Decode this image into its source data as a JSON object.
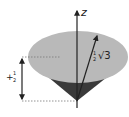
{
  "diagram": {
    "axis_label": "z",
    "vector_label": {
      "fraction_num": "1",
      "fraction_den": "2",
      "root": "√3"
    },
    "projection_label": {
      "sign": "+",
      "fraction_num": "1",
      "fraction_den": "2"
    },
    "colors": {
      "cone_top": "#b9b9b9",
      "cone_side": "#3a3a3a",
      "axis": "#222222",
      "dotted": "#777777"
    }
  }
}
